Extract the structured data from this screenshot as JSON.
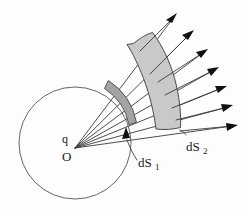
{
  "figure": {
    "background_color": "#fdfdfd",
    "stroke_color": "#333333",
    "labels": {
      "charge": "q",
      "origin": "O",
      "near_surface_base": "dS",
      "near_surface_sub": "1",
      "far_surface_base": "dS",
      "far_surface_sub": "2"
    },
    "colors": {
      "sphere_stroke": "#555555",
      "near_patch_fill": "#a3a3a3",
      "near_patch_stroke": "#4a4a4a",
      "far_patch_fill": "#c9c9c9",
      "far_patch_stroke": "#4a4a4a",
      "ray_stroke": "#3a3a3a",
      "arrow_fill": "#111111",
      "text": "#1a1a1a"
    },
    "geometry": {
      "sphere_center_x": 75,
      "sphere_center_y": 143,
      "sphere_radius": 56,
      "origin_x": 75,
      "origin_y": 148,
      "ray_count": 7
    },
    "annotations": {
      "leader_to_near_patch": "curved leader line with arrowhead",
      "ray_description": "seven straight rays radiating outward with solid arrowheads"
    }
  }
}
